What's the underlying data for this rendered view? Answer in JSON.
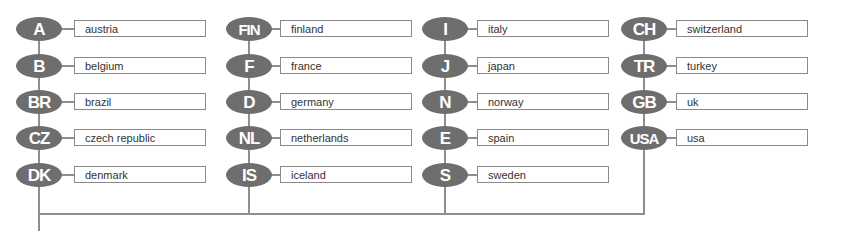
{
  "diagram": {
    "type": "country-code-legend",
    "colors": {
      "oval": "#6e6e6e",
      "line": "#8e8e8e",
      "box_border": "#8a8a8a",
      "text": "#333333"
    },
    "columns": [
      {
        "items": [
          {
            "code": "A",
            "name": "austria"
          },
          {
            "code": "B",
            "name": "belgium"
          },
          {
            "code": "BR",
            "name": "brazil"
          },
          {
            "code": "CZ",
            "name": "czech republic"
          },
          {
            "code": "DK",
            "name": "denmark"
          }
        ]
      },
      {
        "items": [
          {
            "code": "FIN",
            "name": "finland"
          },
          {
            "code": "F",
            "name": "france"
          },
          {
            "code": "D",
            "name": "germany"
          },
          {
            "code": "NL",
            "name": "netherlands"
          },
          {
            "code": "IS",
            "name": "iceland"
          }
        ]
      },
      {
        "items": [
          {
            "code": "I",
            "name": "italy"
          },
          {
            "code": "J",
            "name": "japan"
          },
          {
            "code": "N",
            "name": "norway"
          },
          {
            "code": "E",
            "name": "spain"
          },
          {
            "code": "S",
            "name": "sweden"
          }
        ]
      },
      {
        "items": [
          {
            "code": "CH",
            "name": "switzerland"
          },
          {
            "code": "TR",
            "name": "turkey"
          },
          {
            "code": "GB",
            "name": "uk"
          },
          {
            "code": "USA",
            "name": "usa"
          }
        ]
      }
    ]
  }
}
